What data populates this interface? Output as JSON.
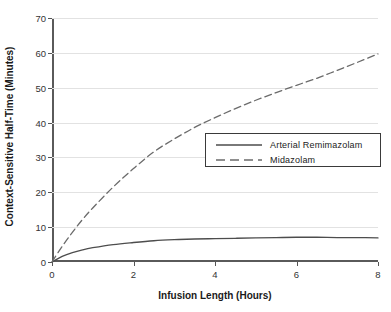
{
  "chart_data": {
    "type": "line",
    "title": "",
    "xlabel": "Infusion Length (Hours)",
    "ylabel": "Context-Sensitive Half-Time (Minutes)",
    "xlim": [
      0,
      8
    ],
    "ylim": [
      0,
      70
    ],
    "xticks": [
      "0",
      "2",
      "4",
      "6",
      "8"
    ],
    "xtick_values": [
      0,
      2,
      4,
      6,
      8
    ],
    "yticks": [
      "0",
      "10",
      "20",
      "30",
      "40",
      "50",
      "60",
      "70"
    ],
    "ytick_values": [
      0,
      10,
      20,
      30,
      40,
      50,
      60,
      70
    ],
    "grid": "horizontal",
    "legend_position": "center-right",
    "x": [
      0,
      0.25,
      0.5,
      0.75,
      1,
      1.5,
      2,
      2.5,
      3,
      3.5,
      4,
      4.5,
      5,
      5.5,
      6,
      6.5,
      7,
      7.5,
      8
    ],
    "series": [
      {
        "name": "Arterial Remimazolam",
        "style": "solid",
        "color": "#4d4d4d",
        "values": [
          0,
          1.6,
          2.7,
          3.5,
          4.1,
          5.0,
          5.6,
          6.1,
          6.4,
          6.6,
          6.7,
          6.8,
          6.9,
          7.0,
          7.1,
          7.1,
          7.0,
          7.0,
          6.9
        ]
      },
      {
        "name": "Midazolam",
        "style": "dashed",
        "color": "#6b6b6b",
        "values": [
          0,
          4.5,
          8.5,
          12.2,
          15.5,
          21.5,
          26.8,
          31.6,
          35.3,
          38.6,
          41.4,
          44.0,
          46.4,
          48.6,
          50.7,
          52.7,
          55.0,
          57.3,
          59.7
        ]
      }
    ]
  },
  "legend": {
    "items": [
      {
        "label": "Arterial Remimazolam",
        "style": "solid"
      },
      {
        "label": "Midazolam",
        "style": "dashed"
      }
    ]
  },
  "axes": {
    "y_title": "Context-Sensitive Half-Time (Minutes)",
    "x_title": "Infusion Length (Hours)"
  }
}
